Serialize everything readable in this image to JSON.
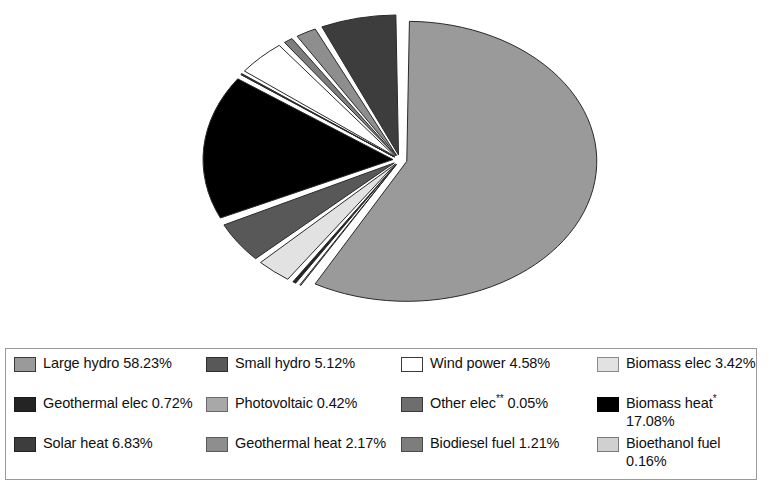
{
  "chart_data": {
    "type": "pie",
    "title": "",
    "subtitle": "",
    "xlabel": "",
    "ylabel": "",
    "legend_position": "bottom",
    "grid": false,
    "units": "percent",
    "exploded": true,
    "start_angle_deg": 0,
    "direction": "clockwise",
    "categories": [
      "Large hydro",
      "Small hydro",
      "Wind power",
      "Biomass elec",
      "Geothermal elec",
      "Photovoltaic",
      "Other elec**",
      "Biomass heat*",
      "Solar heat",
      "Geothermal heat",
      "Biodiesel fuel",
      "Bioethanol fuel"
    ],
    "values": [
      58.23,
      5.12,
      4.58,
      3.42,
      0.72,
      0.42,
      0.05,
      17.08,
      6.83,
      2.17,
      1.21,
      0.16
    ],
    "colors": [
      "#9a9a9a",
      "#585858",
      "#ffffff",
      "#e2e2e2",
      "#242424",
      "#a8a8a8",
      "#6e6e6e",
      "#000000",
      "#3d3d3d",
      "#8e8e8e",
      "#7d7d7d",
      "#d0d0d0"
    ],
    "slices": [
      {
        "label": "Large hydro",
        "value": 58.23,
        "value_text": "58.23%",
        "color": "#9a9a9a"
      },
      {
        "label": "Photovoltaic",
        "value": 0.42,
        "value_text": "0.42%",
        "color": "#a8a8a8"
      },
      {
        "label": "Geothermal elec",
        "value": 0.72,
        "value_text": "0.72%",
        "color": "#242424"
      },
      {
        "label": "Biomass elec",
        "value": 3.42,
        "value_text": "3.42%",
        "color": "#e2e2e2"
      },
      {
        "label": "Small hydro",
        "value": 5.12,
        "value_text": "5.12%",
        "color": "#585858"
      },
      {
        "label": "Biomass heat*",
        "value": 17.08,
        "value_text": "17.08%",
        "color": "#000000"
      },
      {
        "label": "Other elec**",
        "value": 0.05,
        "value_text": "0.05%",
        "color": "#6e6e6e"
      },
      {
        "label": "Bioethanol fuel",
        "value": 0.16,
        "value_text": "0.16%",
        "color": "#d0d0d0"
      },
      {
        "label": "Wind power",
        "value": 4.58,
        "value_text": "4.58%",
        "color": "#ffffff"
      },
      {
        "label": "Biodiesel fuel",
        "value": 1.21,
        "value_text": "1.21%",
        "color": "#7d7d7d"
      },
      {
        "label": "Geothermal heat",
        "value": 2.17,
        "value_text": "2.17%",
        "color": "#8e8e8e"
      },
      {
        "label": "Solar heat",
        "value": 6.83,
        "value_text": "6.83%",
        "color": "#3d3d3d"
      }
    ]
  },
  "legend": {
    "entries": [
      {
        "name": "Large hydro",
        "text": "Large hydro 58.23%",
        "label": "Large hydro",
        "value_text": "58.23%",
        "color": "#9a9a9a",
        "border": "#3a3a3a",
        "asterisk": ""
      },
      {
        "name": "Small hydro",
        "text": "Small hydro 5.12%",
        "label": "Small hydro",
        "value_text": "5.12%",
        "color": "#585858",
        "border": "#2e2e2e",
        "asterisk": ""
      },
      {
        "name": "Wind power",
        "text": "Wind power 4.58%",
        "label": "Wind power",
        "value_text": "4.58%",
        "color": "#ffffff",
        "border": "#3a3a3a",
        "asterisk": ""
      },
      {
        "name": "Biomass elec",
        "text": "Biomass elec 3.42%",
        "label": "Biomass elec",
        "value_text": "3.42%",
        "color": "#e2e2e2",
        "border": "#8a8a8a",
        "asterisk": ""
      },
      {
        "name": "Geothermal elec",
        "text": "Geothermal elec 0.72%",
        "label": "Geothermal elec",
        "value_text": "0.72%",
        "color": "#242424",
        "border": "#1a1a1a",
        "asterisk": ""
      },
      {
        "name": "Photovoltaic",
        "text": "Photovoltaic 0.42%",
        "label": "Photovoltaic",
        "value_text": "0.42%",
        "color": "#a8a8a8",
        "border": "#6a6a6a",
        "asterisk": ""
      },
      {
        "name": "Other elec",
        "text": "Other elec** 0.05%",
        "label": "Other elec",
        "value_text": "0.05%",
        "color": "#6e6e6e",
        "border": "#3a3a3a",
        "asterisk": "**"
      },
      {
        "name": "Biomass heat",
        "text": "Biomass heat* 17.08%",
        "label": "Biomass heat",
        "value_text": "17.08%",
        "color": "#000000",
        "border": "#000000",
        "asterisk": "*"
      },
      {
        "name": "Solar heat",
        "text": "Solar heat 6.83%",
        "label": "Solar heat",
        "value_text": "6.83%",
        "color": "#3d3d3d",
        "border": "#222222",
        "asterisk": ""
      },
      {
        "name": "Geothermal heat",
        "text": "Geothermal heat 2.17%",
        "label": "Geothermal heat",
        "value_text": "2.17%",
        "color": "#8e8e8e",
        "border": "#5a5a5a",
        "asterisk": ""
      },
      {
        "name": "Biodiesel fuel",
        "text": "Biodiesel fuel 1.21%",
        "label": "Biodiesel fuel",
        "value_text": "1.21%",
        "color": "#7d7d7d",
        "border": "#4a4a4a",
        "asterisk": ""
      },
      {
        "name": "Bioethanol fuel",
        "text": "Bioethanol fuel 0.16%",
        "label": "Bioethanol fuel",
        "value_text": "0.16%",
        "color": "#d0d0d0",
        "border": "#7a7a7a",
        "asterisk": ""
      }
    ],
    "order": [
      0,
      1,
      2,
      3,
      4,
      5,
      6,
      7,
      8,
      9,
      10,
      11
    ]
  },
  "geometry": {
    "center_x": 400,
    "center_y": 160,
    "radius_x": 190,
    "radius_y": 140,
    "explode_px": 7,
    "gap_deg": 1.6,
    "outline_color": "#2a2a2a",
    "background": "#ffffff"
  }
}
